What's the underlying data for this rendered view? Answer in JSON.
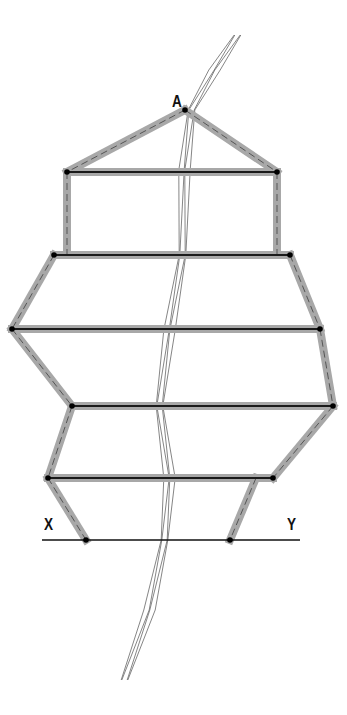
{
  "diagram": {
    "type": "descriptive-geometry-projection",
    "labels": {
      "apex": "A",
      "ground_left": "X",
      "ground_right": "Y"
    },
    "colors": {
      "edge_band": "#a8a8a8",
      "edge_line": "#1a1a1a",
      "dash": "#555555",
      "river": "#555555",
      "vertex": "#000000"
    },
    "ground_line": {
      "x1": 42,
      "y1": 540,
      "x2": 300,
      "y2": 540
    },
    "vertices": {
      "A": [
        185,
        110
      ],
      "TL": [
        67,
        172
      ],
      "TR": [
        277,
        172
      ],
      "B1L": [
        54,
        255
      ],
      "B1R": [
        290,
        255
      ],
      "B2L": [
        12,
        329
      ],
      "B2R": [
        320,
        329
      ],
      "B3L": [
        72,
        406
      ],
      "B3R": [
        333,
        406
      ],
      "B4L": [
        48,
        478
      ],
      "B4R": [
        273,
        478
      ],
      "GL": [
        86,
        540
      ],
      "GR": [
        230,
        540
      ]
    },
    "horizontal_edges": [
      [
        "TL",
        "TR"
      ],
      [
        "B1L",
        "B1R"
      ],
      [
        "B2L",
        "B2R"
      ],
      [
        "B3L",
        "B3R"
      ],
      [
        "B4L",
        "B4R"
      ]
    ],
    "dashed_edges": [
      [
        "A",
        "TL"
      ],
      [
        "A",
        "TR"
      ],
      [
        [
          67,
          172
        ],
        [
          67,
          255
        ]
      ],
      [
        [
          277,
          172
        ],
        [
          277,
          255
        ]
      ],
      [
        "B1L",
        "B2L"
      ],
      [
        "B2L",
        "B3L"
      ],
      [
        "B3L",
        "B4L"
      ],
      [
        "B4L",
        "GL"
      ],
      [
        "B1R",
        "B2R"
      ],
      [
        "B2R",
        "B3R"
      ],
      [
        "B3R",
        "B4R"
      ],
      [
        [
          256,
          478
        ],
        "GR"
      ]
    ]
  }
}
